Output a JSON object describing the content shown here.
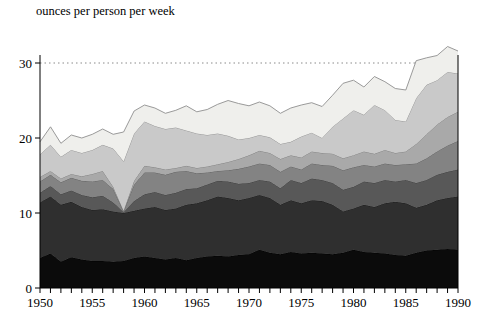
{
  "title": "ounces per person per week",
  "chart_data": {
    "type": "area",
    "stacked": true,
    "title": "ounces per person per week",
    "xlabel": "",
    "ylabel": "",
    "x_range": [
      1950,
      1990
    ],
    "ylim": [
      0,
      35
    ],
    "yticks": [
      0,
      10,
      20,
      30
    ],
    "xticks": [
      1950,
      1955,
      1960,
      1965,
      1970,
      1975,
      1980,
      1985,
      1990
    ],
    "x_minor_tick_step": 1,
    "grid": "off",
    "legend": "none",
    "reference_line": {
      "y": 30,
      "style": "dotted",
      "color": "#8a8a8a"
    },
    "frame": {
      "left": true,
      "right": true,
      "bottom": true,
      "top": false
    },
    "x": [
      1950,
      1951,
      1952,
      1953,
      1954,
      1955,
      1956,
      1957,
      1958,
      1959,
      1960,
      1961,
      1962,
      1963,
      1964,
      1965,
      1966,
      1967,
      1968,
      1969,
      1970,
      1971,
      1972,
      1973,
      1974,
      1975,
      1976,
      1977,
      1978,
      1979,
      1980,
      1981,
      1982,
      1983,
      1984,
      1985,
      1986,
      1987,
      1988,
      1989,
      1990
    ],
    "series": [
      {
        "name": "band-1-black",
        "fill": "#0b0b0b",
        "edge": "#000000",
        "values": [
          4.0,
          4.6,
          3.5,
          4.1,
          3.8,
          3.6,
          3.6,
          3.5,
          3.6,
          4.0,
          4.2,
          4.0,
          3.8,
          4.0,
          3.7,
          4.0,
          4.2,
          4.3,
          4.2,
          4.4,
          4.5,
          5.1,
          4.7,
          4.5,
          4.8,
          4.6,
          4.7,
          4.6,
          4.5,
          4.7,
          5.1,
          4.8,
          4.7,
          4.6,
          4.4,
          4.3,
          4.7,
          5.0,
          5.1,
          5.2,
          5.1
        ]
      },
      {
        "name": "band-2-very-dark-gray",
        "fill": "#2f2f2f",
        "edge": "#1a1a1a",
        "values": [
          7.4,
          7.6,
          7.6,
          7.4,
          7.0,
          6.8,
          6.9,
          6.7,
          6.4,
          6.3,
          6.4,
          6.8,
          6.6,
          6.6,
          7.4,
          7.3,
          7.5,
          7.9,
          7.8,
          7.3,
          7.5,
          7.3,
          7.3,
          6.6,
          6.9,
          6.7,
          7.0,
          7.0,
          6.6,
          5.5,
          5.5,
          6.3,
          6.1,
          6.7,
          7.1,
          7.0,
          6.0,
          6.1,
          6.6,
          6.8,
          7.1
        ]
      },
      {
        "name": "band-3-dark-gray",
        "fill": "#585858",
        "edge": "#3c3c3c",
        "values": [
          1.3,
          1.4,
          1.4,
          1.5,
          1.6,
          1.7,
          1.8,
          1.2,
          0.15,
          1.3,
          1.9,
          2.0,
          2.0,
          2.1,
          2.1,
          2.0,
          2.1,
          2.1,
          2.2,
          2.2,
          2.0,
          2.0,
          2.2,
          2.2,
          2.7,
          2.7,
          2.9,
          2.8,
          2.9,
          2.9,
          2.9,
          3.1,
          3.2,
          3.1,
          2.7,
          3.1,
          3.3,
          3.3,
          3.4,
          3.5,
          3.6
        ]
      },
      {
        "name": "band-4-medium-gray",
        "fill": "#838383",
        "edge": "#5e5e5e",
        "values": [
          1.5,
          1.5,
          1.6,
          1.7,
          1.9,
          2.1,
          2.1,
          1.8,
          0.1,
          2.2,
          2.9,
          2.6,
          2.7,
          2.8,
          2.4,
          2.0,
          1.6,
          1.3,
          1.5,
          2.0,
          2.2,
          2.2,
          2.2,
          2.2,
          1.8,
          1.8,
          2.0,
          2.0,
          2.3,
          2.6,
          2.6,
          2.2,
          2.2,
          2.2,
          2.2,
          2.1,
          2.6,
          2.9,
          3.1,
          3.5,
          3.8
        ]
      },
      {
        "name": "band-5-medium-light-gray",
        "fill": "#a9a9a9",
        "edge": "#7e7e7e",
        "values": [
          0.6,
          0.5,
          0.5,
          0.5,
          0.6,
          1.0,
          1.2,
          0.3,
          0.05,
          0.5,
          0.9,
          0.7,
          0.7,
          0.5,
          0.7,
          0.7,
          0.8,
          0.9,
          1.1,
          1.3,
          1.5,
          1.7,
          1.6,
          1.7,
          1.5,
          1.6,
          1.6,
          1.6,
          1.6,
          1.6,
          1.6,
          1.8,
          1.7,
          1.8,
          1.6,
          1.7,
          2.6,
          3.2,
          3.6,
          3.8,
          3.9
        ]
      },
      {
        "name": "band-6-light-gray",
        "fill": "#c9c9c9",
        "edge": "#909090",
        "values": [
          3.0,
          3.5,
          2.9,
          3.2,
          3.1,
          3.2,
          3.5,
          5.1,
          6.6,
          6.3,
          5.9,
          5.5,
          5.4,
          5.4,
          4.7,
          4.6,
          4.2,
          4.1,
          3.5,
          2.6,
          2.3,
          2.1,
          2.1,
          2.0,
          1.8,
          2.8,
          2.5,
          2.0,
          3.6,
          5.3,
          6.0,
          4.9,
          6.5,
          5.3,
          4.4,
          4.0,
          6.1,
          6.6,
          5.9,
          6.0,
          5.1
        ]
      },
      {
        "name": "band-7-near-white",
        "fill": "#efefec",
        "edge": "#8f8f8f",
        "values": [
          1.7,
          2.4,
          1.8,
          2.0,
          2.0,
          2.1,
          2.1,
          1.9,
          3.9,
          3.0,
          2.2,
          2.4,
          2.1,
          2.3,
          3.3,
          2.9,
          3.4,
          3.9,
          4.7,
          4.8,
          4.3,
          4.4,
          4.2,
          4.1,
          4.5,
          4.2,
          4.0,
          4.2,
          4.2,
          4.7,
          4.0,
          3.7,
          3.8,
          3.8,
          4.2,
          4.2,
          5.0,
          3.6,
          3.3,
          3.4,
          3.0
        ]
      }
    ]
  },
  "axes": {
    "y_tick_labels": [
      "0",
      "10",
      "20",
      "30"
    ],
    "x_tick_labels": [
      "1950",
      "1955",
      "1960",
      "1965",
      "1970",
      "1975",
      "1980",
      "1985",
      "1990"
    ]
  }
}
